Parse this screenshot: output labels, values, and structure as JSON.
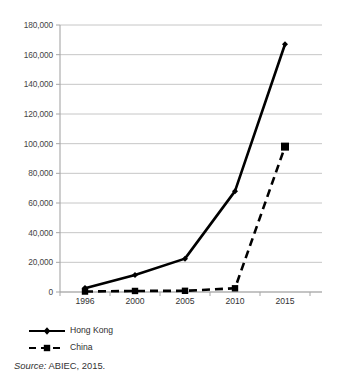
{
  "chart_data": {
    "type": "line",
    "title": "",
    "subtitle": "",
    "xlabel": "",
    "ylabel": "",
    "categories": [
      "1996",
      "2000",
      "2005",
      "2010",
      "2015"
    ],
    "series": [
      {
        "name": "Hong Kong",
        "values": [
          2500,
          11500,
          22500,
          68000,
          167000
        ],
        "line_style": "solid",
        "marker": "diamond",
        "color": "#000000"
      },
      {
        "name": "China",
        "values": [
          300,
          700,
          800,
          2500,
          98000
        ],
        "line_style": "dashed",
        "marker": "square",
        "color": "#000000"
      }
    ],
    "ylim": [
      0,
      180000
    ],
    "ytick_values": [
      0,
      20000,
      40000,
      60000,
      80000,
      100000,
      120000,
      140000,
      160000,
      180000
    ],
    "ytick_labels": [
      "0",
      "20,000",
      "40,000",
      "60,000",
      "80,000",
      "100,000",
      "120,000",
      "140,000",
      "160,000",
      "180,000"
    ],
    "grid": true,
    "grid_axis": "y",
    "grid_color": "#bfbfbf",
    "axis_color": "#a6a6a6",
    "legend_position": "bottom-left",
    "legend": [
      "Hong Kong",
      "China"
    ],
    "background": "#ffffff"
  },
  "source": {
    "label": "Source:",
    "text": " ABIEC, 2015."
  }
}
